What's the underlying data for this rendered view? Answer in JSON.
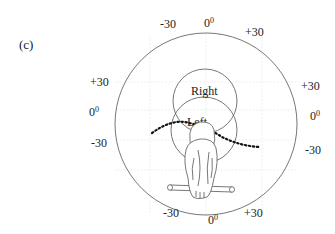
{
  "panel_label": "(c)",
  "circle_labels": {
    "right": "Right",
    "left": "Left"
  },
  "ticks": {
    "top": {
      "minus": "-30",
      "zero": "0",
      "zero_sup": "0",
      "plus": "+30"
    },
    "left": {
      "plus": "+30",
      "zero": "0",
      "zero_sup": "0",
      "minus": "-30"
    },
    "right": {
      "plus": "+30",
      "zero": "0",
      "zero_sup": "0",
      "minus": "-30"
    },
    "bottom": {
      "minus": "-30",
      "zero": "0",
      "zero_sup": "0",
      "plus": "+30"
    }
  },
  "colors": {
    "line": "#555555",
    "grid": "#e4e4e4",
    "dots": "#111111"
  }
}
